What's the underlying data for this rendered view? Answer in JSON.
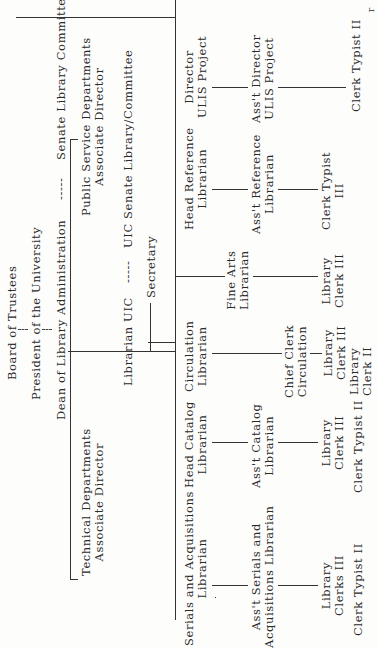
{
  "page_mark": "r",
  "nodes": {
    "board": "Board of Trustees",
    "president": "President of the University",
    "dean": "Dean of Library Administration",
    "dean_link_sep": "-----",
    "senate_committee": "Senate Library Committee",
    "public_service_1": "Public Service Departments",
    "public_service_2": "Associate Director",
    "technical_1": "Technical Departments",
    "technical_2": "Associate Director",
    "librarian_uic": "Librarian UIC",
    "uic_link_sep": "-----",
    "uic_senate": "UIC Senate Library/Committee",
    "secretary": "Secretary",
    "serials_1": "Serials and Acquisitions",
    "serials_2": "Librarian",
    "asst_serials_1": "Ass't Serials and",
    "asst_serials_2": "Acquisitions Librarian",
    "serials_clerks_1": "Library",
    "serials_clerks_2": "Clerks III",
    "serials_typist": "Clerk Typist II",
    "head_catalog_1": "Head Catalog",
    "head_catalog_2": "Librarian",
    "asst_catalog_1": "Ass't Catalog",
    "asst_catalog_2": "Librarian",
    "catalog_clerk_1": "Library",
    "catalog_clerk_2": "Clerk III",
    "catalog_typist": "Clerk Typist II",
    "circulation_1": "Circulation",
    "circulation_2": "Librarian",
    "chief_clerk_1": "Chief Clerk",
    "chief_clerk_2": "Circulation",
    "circ_clerk3_1": "Library",
    "circ_clerk3_2": "Clerk III",
    "circ_clerk2_1": "Library",
    "circ_clerk2_2": "Clerk II",
    "fine_arts_1": "Fine Arts",
    "fine_arts_2": "Librarian",
    "fine_arts_clerk_1": "Library",
    "fine_arts_clerk_2": "Clerk III",
    "head_ref_1": "Head Reference",
    "head_ref_2": "Librarian",
    "asst_ref_1": "Ass't Reference",
    "asst_ref_2": "Librarian",
    "ref_typist_1": "Clerk Typist",
    "ref_typist_2": "III",
    "director_ulis_1": "Director",
    "director_ulis_2": "ULIS Project",
    "asst_director_ulis_1": "Ass't Director",
    "asst_director_ulis_2": "ULIS Project",
    "ulis_typist": "Clerk Typist II"
  }
}
